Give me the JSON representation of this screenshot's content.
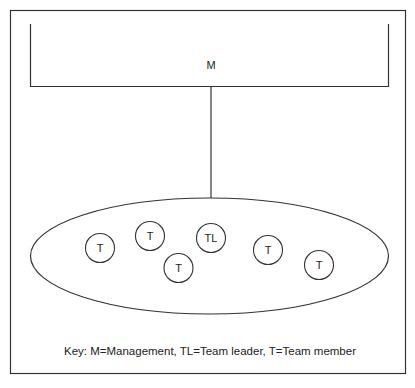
{
  "diagram": {
    "management": {
      "label": "M"
    },
    "team": {
      "members": [
        {
          "label": "T",
          "cx": 100,
          "cy": 248
        },
        {
          "label": "T",
          "cx": 150,
          "cy": 236
        },
        {
          "label": "TL",
          "cx": 211,
          "cy": 238
        },
        {
          "label": "T",
          "cx": 178,
          "cy": 268
        },
        {
          "label": "T",
          "cx": 268,
          "cy": 250
        },
        {
          "label": "T",
          "cx": 319,
          "cy": 265
        }
      ]
    },
    "key": "Key: M=Management, TL=Team leader, T=Team member",
    "colors": {
      "stroke": "#333333",
      "background": "#ffffff"
    }
  }
}
